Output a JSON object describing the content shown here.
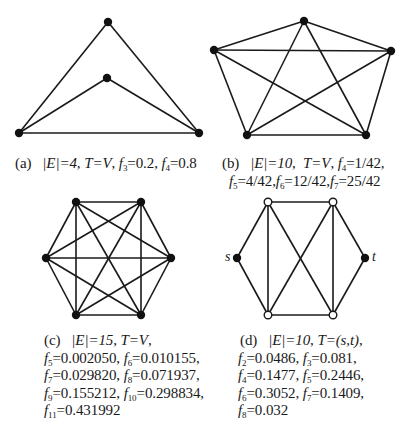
{
  "panels": {
    "a": {
      "tag": "(a)",
      "edges_count": "|E|=4",
      "terminal": "T=V",
      "line1": [
        {
          "f": "3",
          "v": "0.2"
        },
        {
          "f": "4",
          "v": "0.8"
        }
      ],
      "nodes": [
        {
          "x": 108,
          "y": 22,
          "type": "filled"
        },
        {
          "x": 107,
          "y": 78,
          "type": "filled"
        },
        {
          "x": 19,
          "y": 133,
          "type": "filled"
        },
        {
          "x": 199,
          "y": 133,
          "type": "filled"
        }
      ],
      "edges": [
        [
          0,
          2
        ],
        [
          0,
          3
        ],
        [
          1,
          2
        ],
        [
          1,
          3
        ],
        [
          2,
          3
        ]
      ]
    },
    "b": {
      "tag": "(b)",
      "edges_count": "|E|=10",
      "terminal": "T=V",
      "f4": "1/42",
      "f5": "4/42",
      "f6": "12/42",
      "f7": "25/42",
      "nodes": [
        {
          "x": 304,
          "y": 21
        },
        {
          "x": 214,
          "y": 50
        },
        {
          "x": 391,
          "y": 51
        },
        {
          "x": 247,
          "y": 135
        },
        {
          "x": 366,
          "y": 135
        }
      ]
    },
    "c": {
      "tag": "(c)",
      "edges_count": "|E|=15",
      "terminal": "T=V",
      "f5": "0.002050",
      "f6": "0.010155",
      "f7": "0.029820",
      "f8": "0.071937",
      "f9": "0.155212",
      "f10": "0.298834",
      "f11": "0.431992",
      "nodes": [
        {
          "x": 76,
          "y": 202
        },
        {
          "x": 141,
          "y": 202
        },
        {
          "x": 46,
          "y": 258
        },
        {
          "x": 171,
          "y": 258
        },
        {
          "x": 76,
          "y": 315
        },
        {
          "x": 141,
          "y": 315
        }
      ]
    },
    "d": {
      "tag": "(d)",
      "edges_count": "|E|=10",
      "terminal": "T=(s,t)",
      "f2": "0.0486",
      "f3": "0.081",
      "f4": "0.1477",
      "f5": "0.2446",
      "f6": "0.3052",
      "f7": "0.1409",
      "f8": "0.032",
      "source_label": "s",
      "target_label": "t"
    }
  }
}
